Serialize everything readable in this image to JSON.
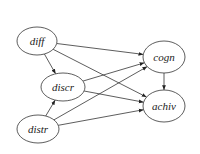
{
  "diagram": {
    "type": "directed-graph",
    "nodes": [
      {
        "id": "diff",
        "label": "diff",
        "cx": 37,
        "cy": 41,
        "rx": 20,
        "ry": 14
      },
      {
        "id": "discr",
        "label": "discr",
        "cx": 63,
        "cy": 87,
        "rx": 22,
        "ry": 14
      },
      {
        "id": "distr",
        "label": "distr",
        "cx": 38,
        "cy": 129,
        "rx": 21,
        "ry": 14
      },
      {
        "id": "cogn",
        "label": "cogn",
        "cx": 164,
        "cy": 57,
        "rx": 21,
        "ry": 16
      },
      {
        "id": "achiv",
        "label": "achiv",
        "cx": 164,
        "cy": 106,
        "rx": 21,
        "ry": 16
      }
    ],
    "edges": [
      {
        "from": "diff",
        "to": "discr"
      },
      {
        "from": "diff",
        "to": "cogn"
      },
      {
        "from": "diff",
        "to": "achiv"
      },
      {
        "from": "discr",
        "to": "cogn"
      },
      {
        "from": "discr",
        "to": "achiv"
      },
      {
        "from": "distr",
        "to": "discr"
      },
      {
        "from": "distr",
        "to": "cogn"
      },
      {
        "from": "distr",
        "to": "achiv"
      },
      {
        "from": "cogn",
        "to": "achiv"
      }
    ],
    "colors": {
      "stroke": "#333333",
      "fill": "#ffffff",
      "text": "#222222"
    }
  }
}
